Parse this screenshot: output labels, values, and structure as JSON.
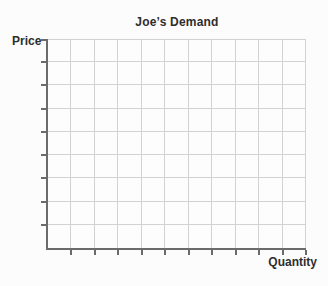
{
  "chart_data": {
    "type": "line",
    "title": "Joe’s Demand",
    "xlabel": "Quantity",
    "ylabel": "Price",
    "series": [],
    "x_tick_labels": [],
    "y_tick_labels": [],
    "grid": true,
    "grid_columns": 11,
    "grid_rows": 9,
    "x_tick_count": 11,
    "y_tick_count": 9,
    "legend_position": "none"
  },
  "colors": {
    "background": "#fcfcfc",
    "plot_background": "#fdfdfd",
    "axis": "#6b6b6b",
    "gridline": "#d2d2d2",
    "text": "#2e2e2e"
  }
}
